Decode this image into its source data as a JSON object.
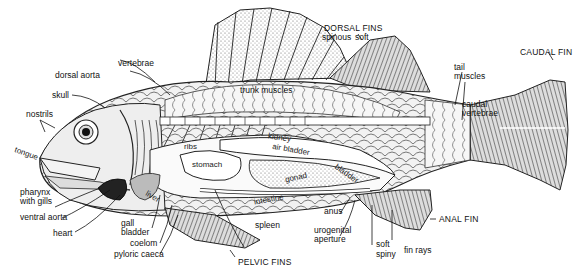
{
  "figure": {
    "labels": {
      "dorsal_fins": "DORSAL FINS",
      "spinous": "spinous",
      "soft": "soft",
      "vertebrae": "vertebrae",
      "dorsal_aorta": "dorsal aorta",
      "skull": "skull",
      "nostrils": "nostrils",
      "trunk_muscles": "trunk muscles",
      "tail_muscles": "tail\nmuscles",
      "caudal_fin": "CAUDAL FIN",
      "caudal_vertebrae": "caudal\nvertebrae",
      "kidney": "kidney",
      "ribs": "ribs",
      "air_bladder": "air bladder",
      "stomach": "stomach",
      "bladder": "bladder",
      "gonad": "gonad",
      "tongue": "tongue",
      "liver": "liver",
      "intestine": "intestine",
      "pharynx": "pharynx\nwith gills",
      "ventral_aorta": "ventral aorta",
      "heart": "heart",
      "gall_bladder": "gall\nbladder",
      "coelom": "coelom",
      "pyloric_caeca": "pyloric caeca",
      "spleen": "spleen",
      "anus": "anus",
      "urogenital_aperture": "urogenital\naperture",
      "anal_fin": "ANAL FIN",
      "fin_soft": "soft",
      "fin_spiny": "spiny",
      "fin_rays": "fin rays",
      "pelvic_fins": "PELVIC FINS"
    }
  }
}
